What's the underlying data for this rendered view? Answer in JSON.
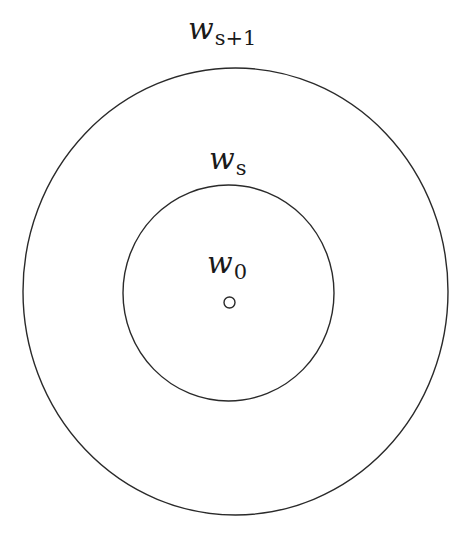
{
  "diagram": {
    "type": "concentric-circles",
    "labels": {
      "outer": {
        "main": "w",
        "sub": "s+1"
      },
      "middle": {
        "main": "w",
        "sub": "s"
      },
      "inner": {
        "main": "w",
        "sub": "0"
      }
    },
    "shapes": {
      "outer_circle": {
        "cx": 235.5,
        "cy": 291.5,
        "rx": 212.5,
        "ry": 223.5
      },
      "middle_circle": {
        "cx": 228.5,
        "cy": 293,
        "rx": 105.5,
        "ry": 108
      },
      "center_point": {
        "cx": 229.5,
        "cy": 302.5,
        "r": 5.5
      }
    },
    "colors": {
      "stroke": "#2a2a2a",
      "background": "#ffffff",
      "text": "#1a1a1a"
    }
  }
}
